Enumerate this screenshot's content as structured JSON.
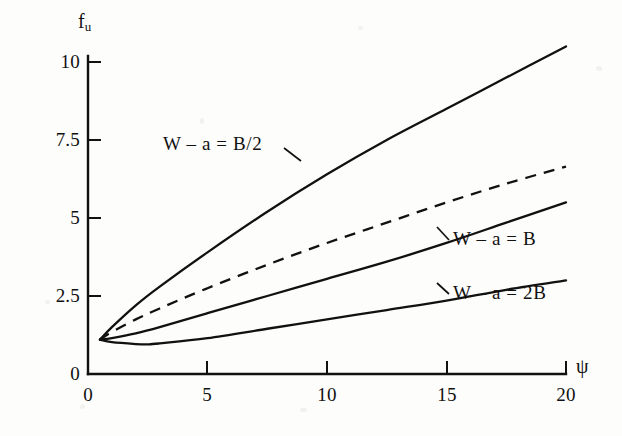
{
  "chart_data": {
    "type": "line",
    "title": "",
    "xlabel": "ψ",
    "ylabel": "f",
    "ylabel_sub": "u",
    "xlim": [
      0,
      20
    ],
    "ylim": [
      0,
      10.8
    ],
    "grid": false,
    "legend_position": "inline-annotations",
    "xticks": [
      0,
      5,
      10,
      15,
      20
    ],
    "xtick_labels": [
      "0",
      "5",
      "10",
      "15",
      "20"
    ],
    "yticks": [
      0,
      2.5,
      5,
      7.5,
      10
    ],
    "ytick_labels": [
      "0",
      "2.5",
      "5",
      "7.5",
      "10"
    ],
    "series": [
      {
        "name": "W – a = B/2",
        "style": "solid",
        "x": [
          0.5,
          1,
          2,
          3,
          5,
          7.5,
          10,
          12.5,
          15,
          17.5,
          20
        ],
        "values": [
          1.1,
          1.5,
          2.2,
          2.8,
          3.9,
          5.2,
          6.4,
          7.5,
          8.5,
          9.5,
          10.5
        ]
      },
      {
        "name": "",
        "style": "dashed",
        "x": [
          0.5,
          1,
          2,
          3,
          5,
          7.5,
          10,
          12.5,
          15,
          17.5,
          20
        ],
        "values": [
          1.1,
          1.35,
          1.75,
          2.1,
          2.75,
          3.5,
          4.2,
          4.85,
          5.5,
          6.1,
          6.65
        ]
      },
      {
        "name": "W – a = B",
        "style": "solid",
        "x": [
          0.5,
          1,
          2,
          3,
          5,
          7.5,
          10,
          12.5,
          15,
          17.5,
          20
        ],
        "values": [
          1.1,
          1.15,
          1.3,
          1.5,
          1.95,
          2.5,
          3.05,
          3.6,
          4.2,
          4.85,
          5.5
        ]
      },
      {
        "name": "W – a = 2B",
        "style": "solid",
        "x": [
          0.5,
          1,
          2,
          2.5,
          3,
          5,
          7.5,
          10,
          12.5,
          15,
          17.5,
          20
        ],
        "values": [
          1.1,
          1.02,
          0.96,
          0.95,
          0.98,
          1.15,
          1.45,
          1.75,
          2.05,
          2.35,
          2.7,
          3.0
        ]
      }
    ],
    "annotations": [
      {
        "text": "W – a = B/2",
        "x": 4.6,
        "y": 7.0
      },
      {
        "text": "W – a = B",
        "x": 13.6,
        "y": 4.0
      },
      {
        "text": "W – a = 2B",
        "x": 13.6,
        "y": 2.25
      }
    ]
  },
  "axis": {
    "y_title": "f",
    "y_title_sub": "u",
    "x_title": "ψ"
  },
  "colors": {
    "ink": "#111111",
    "background": "#fdfdfb"
  }
}
